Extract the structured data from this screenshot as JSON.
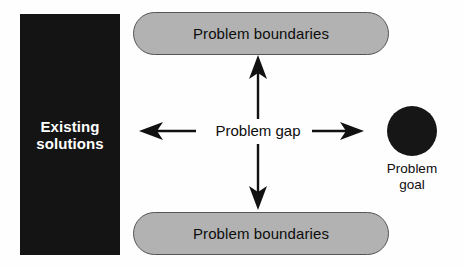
{
  "diagram": {
    "background_color": "#fefefe",
    "solutions_block": {
      "label": "Existing\nsolutions",
      "label_line1": "Existing",
      "label_line2": "solutions",
      "fill_color": "#141414",
      "text_color": "#ffffff"
    },
    "boundary_top": {
      "label": "Problem boundaries",
      "fill_color": "#b2b2b2",
      "stroke_color": "#555555"
    },
    "boundary_bottom": {
      "label": "Problem boundaries",
      "fill_color": "#b2b2b2",
      "stroke_color": "#555555"
    },
    "gap": {
      "label": "Problem gap"
    },
    "goal": {
      "label_line1": "Problem",
      "label_line2": "goal",
      "fill_color": "#161616"
    },
    "arrows": [
      {
        "name": "arrow-left",
        "direction": "left",
        "from": [
          195,
          131
        ],
        "to": [
          140,
          131
        ]
      },
      {
        "name": "arrow-right",
        "direction": "right",
        "from": [
          312,
          131
        ],
        "to": [
          363,
          131
        ]
      },
      {
        "name": "arrow-up",
        "direction": "up",
        "from": [
          258,
          119
        ],
        "to": [
          258,
          56
        ]
      },
      {
        "name": "arrow-down",
        "direction": "down",
        "from": [
          258,
          144
        ],
        "to": [
          258,
          209
        ]
      }
    ]
  }
}
